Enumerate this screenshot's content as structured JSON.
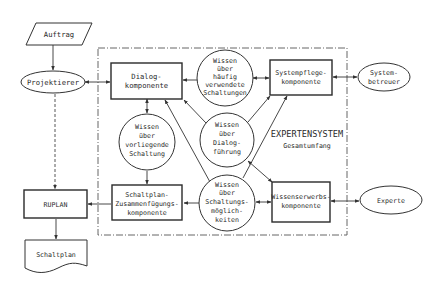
{
  "diagram": {
    "frame_title": "EXPERTENSYSTEM",
    "frame_subtitle": "Gesamtumfang",
    "nodes": {
      "auftrag": {
        "lines": [
          "Auftrag"
        ],
        "shape": "parallelogram"
      },
      "projektierer": {
        "lines": [
          "Projektierer"
        ],
        "shape": "ellipse"
      },
      "dialog": {
        "lines": [
          "Dialog-",
          "komponente"
        ],
        "shape": "rectangle"
      },
      "haeufig": {
        "lines": [
          "Wissen",
          "über",
          "häufig",
          "verwendete",
          "Schaltungen"
        ],
        "shape": "circle"
      },
      "systempflege": {
        "lines": [
          "Systempflege-",
          "komponente"
        ],
        "shape": "rectangle"
      },
      "systembetreuer": {
        "lines": [
          "System-",
          "betreuer"
        ],
        "shape": "ellipse"
      },
      "vorliegend": {
        "lines": [
          "Wissen",
          "über",
          "vorliegende",
          "Schaltung"
        ],
        "shape": "circle"
      },
      "dialogfuehrung": {
        "lines": [
          "Wissen",
          "über",
          "Dialog-",
          "führung"
        ],
        "shape": "circle"
      },
      "zusammenfuegung": {
        "lines": [
          "Schaltplan-",
          "Zusammenfügungs-",
          "komponente"
        ],
        "shape": "rectangle"
      },
      "moeglichkeiten": {
        "lines": [
          "Wissen",
          "über",
          "Schaltungs-",
          "möglich-",
          "keiten"
        ],
        "shape": "circle"
      },
      "wissenserwerb": {
        "lines": [
          "Wissenserwerbs-",
          "komponente"
        ],
        "shape": "rectangle"
      },
      "experte": {
        "lines": [
          "Experte"
        ],
        "shape": "ellipse"
      },
      "ruplan": {
        "lines": [
          "RUPLAN"
        ],
        "shape": "rectangle"
      },
      "schaltplan": {
        "lines": [
          "Schaltplan"
        ],
        "shape": "document"
      }
    },
    "edges": [
      {
        "from": "Auftrag",
        "to": "Projektierer",
        "style": "solid"
      },
      {
        "from": "Projektierer",
        "to": "Dialogkomponente",
        "style": "solid",
        "bidirectional": true
      },
      {
        "from": "Projektierer",
        "to": "RUPLAN",
        "style": "dashed"
      },
      {
        "from": "Wissen über häufig verwendete Schaltungen",
        "to": "Dialogkomponente",
        "style": "solid"
      },
      {
        "from": "Wissen über häufig verwendete Schaltungen",
        "to": "Systempflegekomponente",
        "style": "solid",
        "bidirectional": true
      },
      {
        "from": "Systempflegekomponente",
        "to": "Systembetreuer",
        "style": "solid",
        "bidirectional": true
      },
      {
        "from": "Dialogkomponente",
        "to": "Wissen über vorliegende Schaltung",
        "style": "solid",
        "bidirectional": true
      },
      {
        "from": "Wissen über vorliegende Schaltung",
        "to": "Schaltplan-Zusammenfügungskomponente",
        "style": "solid"
      },
      {
        "from": "Wissen über Dialogführung",
        "to": "Dialogkomponente",
        "style": "solid"
      },
      {
        "from": "Wissen über Dialogführung",
        "to": "Systempflegekomponente",
        "style": "solid"
      },
      {
        "from": "Wissen über Schaltungsmöglichkeiten",
        "to": "Dialogkomponente",
        "style": "solid"
      },
      {
        "from": "Wissen über Schaltungsmöglichkeiten",
        "to": "Systempflegekomponente",
        "style": "solid"
      },
      {
        "from": "Wissen über Dialogführung",
        "to": "Wissenserwerbskomponente",
        "style": "solid",
        "bidirectional": true
      },
      {
        "from": "Wissen über Schaltungsmöglichkeiten",
        "to": "Schaltplan-Zusammenfügungskomponente",
        "style": "solid"
      },
      {
        "from": "Wissen über Schaltungsmöglichkeiten",
        "to": "Wissenserwerbskomponente",
        "style": "solid",
        "bidirectional": true
      },
      {
        "from": "Wissenserwerbskomponente",
        "to": "Experte",
        "style": "solid",
        "bidirectional": true
      },
      {
        "from": "Schaltplan-Zusammenfügungskomponente",
        "to": "RUPLAN",
        "style": "solid"
      },
      {
        "from": "RUPLAN",
        "to": "Schaltplan",
        "style": "solid"
      }
    ]
  }
}
